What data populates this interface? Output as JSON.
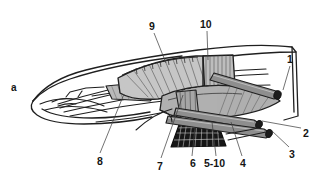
{
  "figure": {
    "panel_label": "a",
    "type": "anatomical-line-drawing",
    "background_color": "#ffffff",
    "ink_color": "#1a1a1a",
    "fill_light": "#d3d3d3",
    "fill_mid": "#9a9a9a",
    "fill_dark": "#6d6d6d",
    "fill_black": "#141414",
    "callouts": [
      {
        "id": "c9",
        "text": "9",
        "x": 149,
        "y": 21,
        "leader": [
          [
            154,
            33
          ],
          [
            166,
            63
          ]
        ]
      },
      {
        "id": "c10",
        "text": "10",
        "x": 200,
        "y": 19,
        "leader": [
          [
            207,
            31
          ],
          [
            208,
            60
          ]
        ]
      },
      {
        "id": "c1",
        "text": "1",
        "x": 287,
        "y": 54,
        "leader": [
          [
            290,
            66
          ],
          [
            283,
            90
          ]
        ]
      },
      {
        "id": "c2",
        "text": "2",
        "x": 303,
        "y": 128,
        "leader": [
          [
            301,
            128
          ],
          [
            262,
            121
          ]
        ]
      },
      {
        "id": "c3",
        "text": "3",
        "x": 289,
        "y": 149,
        "leader": [
          [
            289,
            147
          ],
          [
            272,
            131
          ]
        ]
      },
      {
        "id": "c4",
        "text": "4",
        "x": 240,
        "y": 158,
        "leader": [
          [
            242,
            156
          ],
          [
            231,
            122
          ]
        ]
      },
      {
        "id": "c5-10",
        "text": "5-10",
        "x": 204,
        "y": 158,
        "leader": [
          [
            216,
            156
          ],
          [
            212,
            122
          ]
        ]
      },
      {
        "id": "c6",
        "text": "6",
        "x": 190,
        "y": 158,
        "leader": [
          [
            192,
            156
          ],
          [
            195,
            128
          ]
        ]
      },
      {
        "id": "c7",
        "text": "7",
        "x": 157,
        "y": 161,
        "leader": [
          [
            161,
            158
          ],
          [
            183,
            95
          ]
        ]
      },
      {
        "id": "c8",
        "text": "8",
        "x": 97,
        "y": 156,
        "leader": [
          [
            100,
            153
          ],
          [
            124,
            94
          ]
        ]
      }
    ]
  }
}
